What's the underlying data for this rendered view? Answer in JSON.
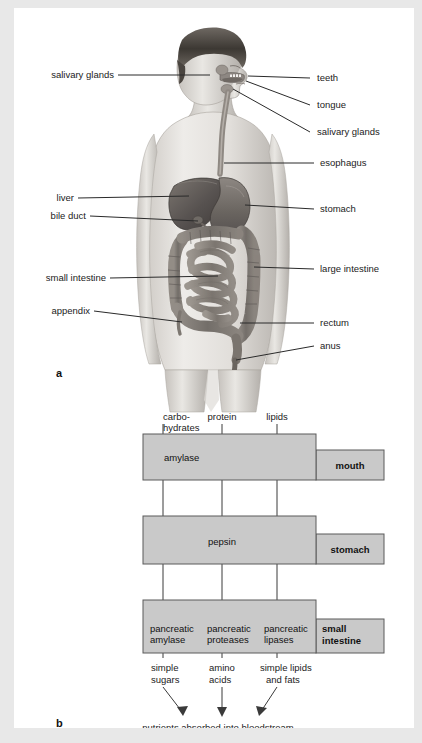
{
  "figure": {
    "panel_a": {
      "letter": "a",
      "title_alt": "human digestive system anatomy",
      "labels_left": [
        {
          "name": "salivary glands",
          "text": "salivary glands"
        },
        {
          "name": "liver",
          "text": "liver"
        },
        {
          "name": "bile duct",
          "text": "bile duct"
        },
        {
          "name": "small intestine",
          "text": "small intestine"
        },
        {
          "name": "appendix",
          "text": "appendix"
        }
      ],
      "labels_right": [
        {
          "name": "teeth",
          "text": "teeth"
        },
        {
          "name": "tongue",
          "text": "tongue"
        },
        {
          "name": "salivary glands",
          "text": "salivary glands"
        },
        {
          "name": "esophagus",
          "text": "esophagus"
        },
        {
          "name": "stomach",
          "text": "stomach"
        },
        {
          "name": "large intestine",
          "text": "large intestine"
        },
        {
          "name": "rectum",
          "text": "rectum"
        },
        {
          "name": "anus",
          "text": "anus"
        }
      ]
    },
    "panel_b": {
      "letter": "b",
      "nutrient_inputs": [
        {
          "line1": "carbo-",
          "line2": "hydrates"
        },
        {
          "line1": "protein",
          "line2": ""
        },
        {
          "line1": "lipids",
          "line2": ""
        }
      ],
      "rows": [
        {
          "organ": "mouth",
          "organ_line1": "mouth",
          "organ_line2": "",
          "enzymes": [
            {
              "line1": "amylase",
              "line2": ""
            }
          ]
        },
        {
          "organ": "stomach",
          "organ_line1": "stomach",
          "organ_line2": "",
          "enzymes": [
            {
              "line1": "pepsin",
              "line2": ""
            }
          ]
        },
        {
          "organ": "small intestine",
          "organ_line1": "small",
          "organ_line2": "intestine",
          "enzymes": [
            {
              "line1": "pancreatic",
              "line2": "amylase"
            },
            {
              "line1": "pancreatic",
              "line2": "proteases"
            },
            {
              "line1": "pancreatic",
              "line2": "lipases"
            }
          ]
        }
      ],
      "products": [
        {
          "line1": "simple",
          "line2": "sugars"
        },
        {
          "line1": "amino",
          "line2": "acids"
        },
        {
          "line1": "simple lipids",
          "line2": "and fats"
        }
      ],
      "footer": "nutrients absorbed into bloodstream"
    }
  },
  "colors": {
    "page_background": "#e8e8e8",
    "sheet": "#ffffff",
    "box_fill": "#c9c9c9",
    "box_stroke": "#5a5a5a",
    "text": "#1b1b1b"
  }
}
